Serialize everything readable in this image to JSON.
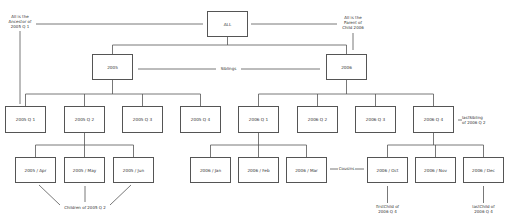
{
  "diagram": {
    "root": {
      "label": "ALL"
    },
    "years": [
      {
        "label": "2005"
      },
      {
        "label": "2006"
      }
    ],
    "quarters": [
      {
        "label": "2005 Q 1"
      },
      {
        "label": "2005 Q 2"
      },
      {
        "label": "2005 Q 3"
      },
      {
        "label": "2005 Q 4"
      },
      {
        "label": "2006 Q 1"
      },
      {
        "label": "2006 Q 2"
      },
      {
        "label": "2006 Q 3"
      },
      {
        "label": "2006 Q 4"
      }
    ],
    "months": [
      {
        "label": "2005 / Apr"
      },
      {
        "label": "2005 / May"
      },
      {
        "label": "2005 / Jun"
      },
      {
        "label": "2006 / Jan"
      },
      {
        "label": "2006 / Feb"
      },
      {
        "label": "2006 / Mar"
      },
      {
        "label": "2006 / Oct"
      },
      {
        "label": "2006 / Nov"
      },
      {
        "label": "2006 / Dec"
      }
    ],
    "annotations": {
      "ancestor": [
        "All is the",
        "Ancestor of",
        "2005 Q 1"
      ],
      "parent": [
        "All is the",
        "Parent of",
        "Child 2006"
      ],
      "siblings": "Siblings",
      "last_sibling": [
        "lastSibling",
        "of 2006 Q 2"
      ],
      "cousins": "Cousins",
      "children": "Children of 2005 Q 2",
      "first_child": [
        "firstChild of",
        "2006 Q 4"
      ],
      "last_child": [
        "lastChild of",
        "2006 Q 4"
      ]
    },
    "colors": {
      "line": "#555555",
      "box_border": "#555555",
      "background": "#ffffff"
    }
  }
}
